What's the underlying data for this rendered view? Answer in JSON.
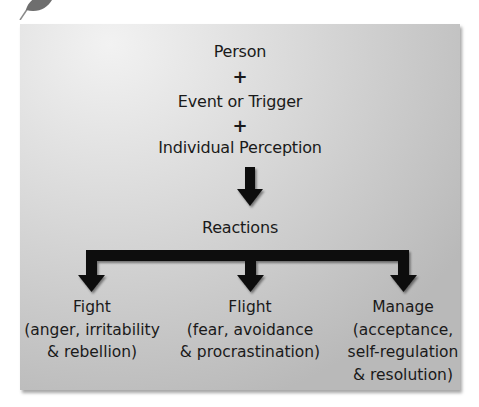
{
  "diagram": {
    "inputs": [
      "Person",
      "Event or Trigger",
      "Individual Perception"
    ],
    "joiner": "+",
    "center_node": "Reactions",
    "outcomes": [
      {
        "title": "Fight",
        "line2": "(anger, irritability",
        "line3": "& rebellion)",
        "line4": ""
      },
      {
        "title": "Flight",
        "line2": "(fear, avoidance",
        "line3": "& procrastination)",
        "line4": ""
      },
      {
        "title": "Manage",
        "line2": "(acceptance,",
        "line3": "self-regulation",
        "line4": "& resolution)"
      }
    ]
  },
  "colors": {
    "arrow": "#0d0d0d",
    "box_light": "#f2f2f2",
    "box_dark": "#b9b9b9",
    "leaf": "#6e6e6e"
  }
}
